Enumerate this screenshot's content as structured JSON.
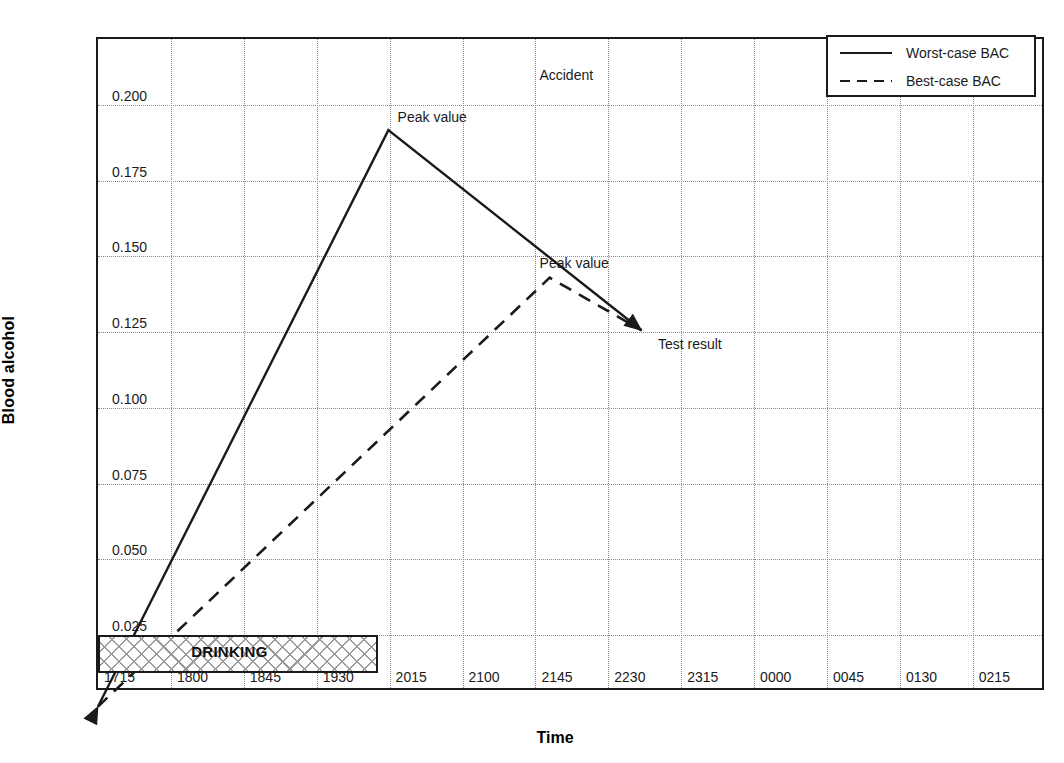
{
  "chart_data": {
    "type": "line",
    "title": "",
    "xlabel": "Time",
    "ylabel": "Blood alcohol",
    "grid": true,
    "legend_position": "top-right",
    "x_categories": [
      "1715",
      "1800",
      "1845",
      "1930",
      "2015",
      "2100",
      "2145",
      "2230",
      "2315",
      "0000",
      "0045",
      "0130",
      "0215"
    ],
    "y_ticks": [
      "0.025",
      "0.050",
      "0.075",
      "0.100",
      "0.125",
      "0.150",
      "0.175",
      "0.200"
    ],
    "y_tick_values": [
      0.025,
      0.05,
      0.075,
      0.1,
      0.125,
      0.15,
      0.175,
      0.2
    ],
    "ylim": [
      0.0,
      0.2175
    ],
    "series": [
      {
        "name": "Worst-case BAC",
        "style": "solid",
        "color": "#1a1a1a",
        "points": [
          {
            "x": "1715",
            "y": 0.0
          },
          {
            "x": "2015",
            "y": 0.1915
          },
          {
            "x": "2252",
            "y": 0.125
          }
        ]
      },
      {
        "name": "Best-case BAC",
        "style": "dashed",
        "color": "#1a1a1a",
        "points": [
          {
            "x": "1715",
            "y": 0.0
          },
          {
            "x": "2155",
            "y": 0.1425
          },
          {
            "x": "2252",
            "y": 0.125
          }
        ]
      }
    ],
    "annotations": [
      {
        "name": "worst-case-peak",
        "text": "Peak value",
        "x": "2015",
        "y": 0.1915
      },
      {
        "name": "best-case-peak",
        "text": "Peak value",
        "x": "2155",
        "y": 0.1425
      },
      {
        "name": "accident",
        "text": "Accident",
        "x": "2145",
        "y": 0.2065
      },
      {
        "name": "test-result",
        "text": "Test result",
        "x": "2252",
        "y": 0.125
      }
    ],
    "spans": [
      {
        "name": "drinking",
        "label": "DRINKING",
        "start": "1715",
        "end": "2008",
        "hatch": "crosshatch"
      }
    ]
  },
  "legend": {
    "items": [
      {
        "label": "Worst-case BAC",
        "style": "solid"
      },
      {
        "label": "Best-case BAC",
        "style": "dashed"
      }
    ]
  }
}
